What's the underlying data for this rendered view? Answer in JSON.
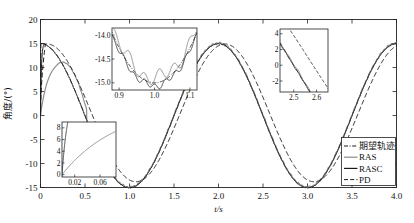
{
  "chart_data": {
    "type": "line",
    "title": "",
    "xlabel": "t/s",
    "ylabel": "角度/(°)",
    "xlim": [
      0,
      4.0
    ],
    "ylim": [
      -15,
      20
    ],
    "xticks": [
      "0",
      "0.5",
      "1.0",
      "1.5",
      "2.0",
      "2.5",
      "3.0",
      "3.5",
      "4.0"
    ],
    "xtick_values": [
      0,
      0.5,
      1.0,
      1.5,
      2.0,
      2.5,
      3.0,
      3.5,
      4.0
    ],
    "yticks": [
      "20",
      "15",
      "10",
      "5",
      "0",
      "-5",
      "-10",
      "-15"
    ],
    "ytick_values": [
      20,
      15,
      10,
      5,
      0,
      -5,
      -10,
      -15
    ],
    "grid": false,
    "legend_position": "bottom-right",
    "legend": [
      {
        "label": "期望轨迹",
        "style": "dash-dot",
        "color": "#1a1a1a"
      },
      {
        "label": "RAS",
        "style": "solid",
        "color": "#8a8a8a"
      },
      {
        "label": "RASC",
        "style": "solid",
        "color": "#1a1a1a"
      },
      {
        "label": "PD",
        "style": "dashed",
        "color": "#1a1a1a"
      }
    ],
    "series": [
      {
        "name": "期望轨迹",
        "description": "Desired trajectory: 15*cos(pi*t), step start from 0",
        "amplitude": 15,
        "period": 2.0,
        "start_value": 0,
        "style": "dash-dot"
      },
      {
        "name": "RAS",
        "description": "RAS controller response, slow initial rise peaking near 11.5 deg at t=0.28",
        "amplitude": 15,
        "period": 2.0,
        "style": "solid-gray"
      },
      {
        "name": "RASC",
        "description": "RASC controller response, fast tracking close to desired",
        "amplitude": 15,
        "period": 2.0,
        "style": "solid-black"
      },
      {
        "name": "PD",
        "description": "PD controller response, lagging with phase delay",
        "amplitude": 14.2,
        "period": 2.0,
        "style": "dashed"
      }
    ],
    "insets": [
      {
        "id": "inset-trough",
        "region": "trough near t=1.0",
        "xticks": [
          "0.9",
          "1.0",
          "1.1"
        ],
        "xtick_values": [
          0.9,
          1.0,
          1.1
        ],
        "yticks": [
          "-14.0",
          "-14.5",
          "-15.0"
        ],
        "ytick_values": [
          -14.0,
          -14.5,
          -15.0
        ],
        "xlim": [
          0.88,
          1.12
        ],
        "ylim": [
          -15.15,
          -13.85
        ]
      },
      {
        "id": "inset-startup",
        "region": "startup transient near t=0",
        "xticks": [
          "0.02",
          "0.06"
        ],
        "xtick_values": [
          0.02,
          0.06
        ],
        "yticks": [
          "0",
          "2",
          "4",
          "6",
          "8"
        ],
        "ytick_values": [
          0,
          2,
          4,
          6,
          8
        ],
        "xlim": [
          0.0,
          0.085
        ],
        "ylim": [
          -0.4,
          9.0
        ]
      },
      {
        "id": "inset-crossing",
        "region": "zero crossing near t=2.5",
        "xticks": [
          "2.5",
          "2.6"
        ],
        "xtick_values": [
          2.5,
          2.6
        ],
        "yticks": [
          "4",
          "2",
          "0",
          "-2"
        ],
        "ytick_values": [
          4,
          2,
          0,
          -2
        ],
        "xlim": [
          2.44,
          2.65
        ],
        "ylim": [
          -3.4,
          4.6
        ]
      }
    ]
  },
  "axis": {
    "xlabel": "t/s",
    "ylabel": "角度/(°)"
  },
  "colors": {
    "desired": "#1a1a1a",
    "ras": "#8a8a8a",
    "rasc": "#1a1a1a",
    "pd": "#1a1a1a",
    "frame": "#222222",
    "background": "#ffffff"
  }
}
